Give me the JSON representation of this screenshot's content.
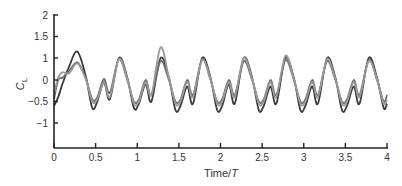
{
  "chart_data": {
    "type": "line",
    "title": "",
    "xlabel": "Time/T",
    "xlabel_main": "Time/",
    "xlabel_italic": "T",
    "ylabel": "C_L",
    "ylabel_main": "C",
    "ylabel_sub": "L",
    "xlim": [
      0,
      4
    ],
    "ylim": [
      -1.5,
      2
    ],
    "x_ticks": [
      {
        "v": 0,
        "label": "0"
      },
      {
        "v": 0.5,
        "label": "0.5"
      },
      {
        "v": 1,
        "label": "1"
      },
      {
        "v": 1.5,
        "label": "1.5"
      },
      {
        "v": 2,
        "label": "2"
      },
      {
        "v": 2.5,
        "label": "2.5"
      },
      {
        "v": 3,
        "label": "3"
      },
      {
        "v": 3.5,
        "label": "3.5"
      },
      {
        "v": 4,
        "label": "4"
      }
    ],
    "y_ticks": [
      {
        "v": 2,
        "label": "2"
      },
      {
        "v": 1.5,
        "label": "1.5"
      },
      {
        "v": 1,
        "label": "1"
      },
      {
        "v": 0,
        "label": "0"
      },
      {
        "v": -0.5,
        "label": "-0.5"
      },
      {
        "v": -1,
        "label": "-1"
      }
    ],
    "grid": false,
    "legend": null,
    "series": [
      {
        "name": "dark curve",
        "color": "#3a3a3a",
        "x": [
          0,
          0.05,
          0.1,
          0.18,
          0.28,
          0.38,
          0.46,
          0.52,
          0.6,
          0.67,
          0.78,
          0.88,
          0.96,
          1.02,
          1.1,
          1.17,
          1.28,
          1.38,
          1.46,
          1.52,
          1.6,
          1.67,
          1.78,
          1.88,
          1.96,
          2.02,
          2.1,
          2.17,
          2.28,
          2.38,
          2.46,
          2.52,
          2.6,
          2.67,
          2.78,
          2.88,
          2.96,
          3.02,
          3.1,
          3.17,
          3.28,
          3.38,
          3.46,
          3.52,
          3.6,
          3.67,
          3.78,
          3.88,
          3.96,
          4.0
        ],
        "y": [
          -0.6,
          -0.4,
          -0.1,
          0.6,
          1.15,
          0.2,
          -0.65,
          -0.5,
          -0.05,
          -0.45,
          1.0,
          0.1,
          -0.65,
          -0.55,
          -0.1,
          -0.5,
          1.0,
          0.1,
          -0.7,
          -0.6,
          -0.15,
          -0.55,
          1.0,
          0.1,
          -0.7,
          -0.6,
          -0.1,
          -0.55,
          1.0,
          0.1,
          -0.7,
          -0.6,
          -0.15,
          -0.55,
          1.0,
          0.1,
          -0.7,
          -0.6,
          -0.15,
          -0.55,
          1.0,
          0.1,
          -0.7,
          -0.6,
          -0.15,
          -0.55,
          1.0,
          0.1,
          -0.65,
          -0.55
        ]
      },
      {
        "name": "medium gray curve",
        "color": "#6e6e6e",
        "x": [
          0,
          0.05,
          0.1,
          0.18,
          0.28,
          0.38,
          0.46,
          0.52,
          0.6,
          0.67,
          0.78,
          0.88,
          0.96,
          1.02,
          1.1,
          1.17,
          1.28,
          1.38,
          1.46,
          1.52,
          1.6,
          1.67,
          1.78,
          1.88,
          1.96,
          2.02,
          2.1,
          2.17,
          2.28,
          2.38,
          2.46,
          2.52,
          2.6,
          2.67,
          2.78,
          2.88,
          2.96,
          3.02,
          3.1,
          3.17,
          3.28,
          3.38,
          3.46,
          3.52,
          3.6,
          3.67,
          3.78,
          3.88,
          3.96,
          4.0
        ],
        "y": [
          -0.45,
          0.0,
          0.1,
          0.4,
          0.8,
          0.1,
          -0.45,
          -0.4,
          0.05,
          -0.3,
          0.95,
          0.0,
          -0.5,
          -0.45,
          0.0,
          -0.35,
          0.85,
          0.0,
          -0.5,
          -0.45,
          0.0,
          -0.35,
          0.95,
          0.0,
          -0.5,
          -0.45,
          0.0,
          -0.35,
          0.85,
          0.0,
          -0.5,
          -0.45,
          0.0,
          -0.35,
          0.9,
          0.0,
          -0.5,
          -0.45,
          0.0,
          -0.35,
          0.85,
          0.0,
          -0.5,
          -0.45,
          0.0,
          -0.35,
          0.9,
          0.0,
          -0.5,
          -0.35
        ]
      },
      {
        "name": "light gray curve",
        "color": "#9a9a9a",
        "x": [
          0,
          0.05,
          0.1,
          0.18,
          0.28,
          0.38,
          0.46,
          0.52,
          0.6,
          0.67,
          0.78,
          0.88,
          0.96,
          1.02,
          1.1,
          1.17,
          1.28,
          1.38,
          1.46,
          1.52,
          1.6,
          1.67,
          1.78,
          1.88,
          1.96,
          2.02,
          2.1,
          2.17,
          2.28,
          2.38,
          2.46,
          2.52,
          2.6,
          2.67,
          2.78,
          2.88,
          2.96,
          3.02,
          3.1,
          3.17,
          3.28,
          3.38,
          3.46,
          3.52,
          3.6,
          3.67,
          3.78,
          3.88,
          3.96,
          4.0
        ],
        "y": [
          -0.3,
          0.1,
          0.35,
          0.3,
          0.75,
          0.05,
          -0.5,
          -0.45,
          -0.05,
          -0.4,
          0.95,
          0.05,
          -0.55,
          -0.5,
          -0.05,
          -0.35,
          1.25,
          0.1,
          -0.55,
          -0.5,
          -0.05,
          -0.4,
          0.9,
          0.05,
          -0.55,
          -0.5,
          -0.05,
          -0.4,
          1.0,
          0.05,
          -0.55,
          -0.5,
          -0.05,
          -0.4,
          1.05,
          0.05,
          -0.55,
          -0.5,
          -0.05,
          -0.4,
          0.95,
          0.05,
          -0.55,
          -0.5,
          -0.05,
          -0.4,
          0.85,
          0.05,
          -0.55,
          -0.45
        ]
      }
    ]
  }
}
